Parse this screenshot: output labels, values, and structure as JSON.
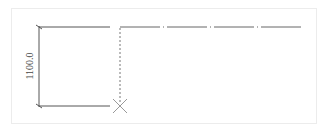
{
  "drawing": {
    "dimension": {
      "label": "1100.0",
      "orientation": "vertical"
    },
    "colors": {
      "line": "#555555",
      "frame": "#ececec",
      "marker": "#999999",
      "background": "#ffffff"
    },
    "elements": [
      {
        "type": "dimension-line",
        "x": 39,
        "y1": 27,
        "y2": 106
      },
      {
        "type": "solid-line",
        "x1": 39,
        "x2": 110,
        "y": 27
      },
      {
        "type": "solid-line",
        "x1": 39,
        "x2": 110,
        "y": 106
      },
      {
        "type": "dashed-line",
        "x": 120,
        "y1": 27,
        "y2": 106
      },
      {
        "type": "dash-dot-line",
        "x1": 120,
        "x2": 302,
        "y": 27
      },
      {
        "type": "x-marker",
        "x": 120,
        "y": 106
      }
    ]
  }
}
